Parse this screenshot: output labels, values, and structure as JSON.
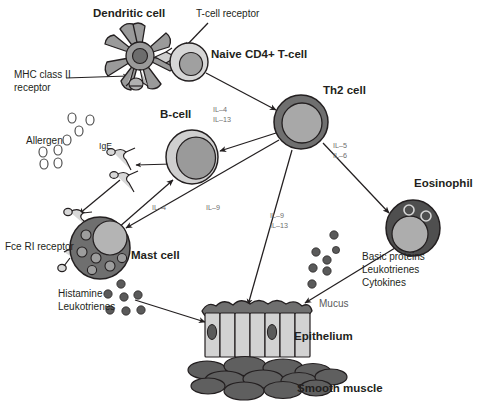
{
  "diagram": {
    "background_color": "#ffffff",
    "outline_color": "#231f20",
    "cytokine_label_color": "#6d6d6d"
  },
  "labels": {
    "dendritic_cell": "Dendritic cell",
    "t_cell_receptor": "T-cell receptor",
    "naive_t_cell": "Naive CD4+ T-cell",
    "mhc_line1": "MHC class II",
    "mhc_line2": "receptor",
    "th2_cell": "Th2 cell",
    "b_cell": "B-cell",
    "allergen": "Allergen",
    "ige": "IgE",
    "fce_receptor": "Fce RI receptor",
    "mast_cell": "Mast cell",
    "histamine": "Histamine",
    "leukotrienes": "Leukotrienes",
    "eosinophil": "Eosinophil",
    "mucus": "Mucus",
    "epithelium": "Epithelium",
    "smooth_muscle": "Smooth muscle"
  },
  "cytokines": {
    "b_cell_il4": "IL–4",
    "b_cell_il13": "IL–13",
    "mast_il4": "IL–4",
    "mast_il9": "IL–9",
    "epi_il9": "IL–9",
    "epi_il13": "IL–13",
    "eos_il5": "IL–5",
    "eos_il6": "IL–6"
  },
  "mediators": {
    "eosinophil": [
      "Basic proteins",
      "Leukotrienes",
      "Cytokines"
    ]
  },
  "cells": [
    {
      "name": "dendritic-cell",
      "fill": "#9a9a9a",
      "nucleus": "#6d6d6d",
      "cx": 140,
      "cy": 56
    },
    {
      "name": "naive-cd4-t-cell",
      "fill": "#d6d6d6",
      "nucleus": "#a0a0a0",
      "cx": 189,
      "cy": 62,
      "r": 19
    },
    {
      "name": "th2-cell",
      "fill": "#6f6f6f",
      "nucleus": "#a8a8a8",
      "cx": 301,
      "cy": 122,
      "r": 27
    },
    {
      "name": "b-cell",
      "fill": "#cfcfcf",
      "nucleus": "#9a9a9a",
      "cx": 192,
      "cy": 157,
      "r": 26
    },
    {
      "name": "mast-cell",
      "fill": "#6f6f6f",
      "nucleus": "#b4b4b4",
      "cx": 99,
      "cy": 247,
      "r": 29
    },
    {
      "name": "eosinophil",
      "fill": "#4f4f4f",
      "nucleus": "#adadad",
      "cx": 413,
      "cy": 228,
      "r": 26
    }
  ],
  "tissue": {
    "epithelium_cells": 7,
    "epithelium_fill": "#d2d2d2",
    "mucus_fill": "#6f6f6f",
    "smooth_muscle_fill": "#5f5f5f",
    "smooth_muscle_count": 14
  },
  "counts": {
    "allergen_particles": 7,
    "mast_granules": 6,
    "histamine_dots": 7,
    "eosinophil_granule_dots": 7,
    "mucus_dots": 7,
    "ige_antibodies": 2,
    "fce_receptors": 2
  }
}
